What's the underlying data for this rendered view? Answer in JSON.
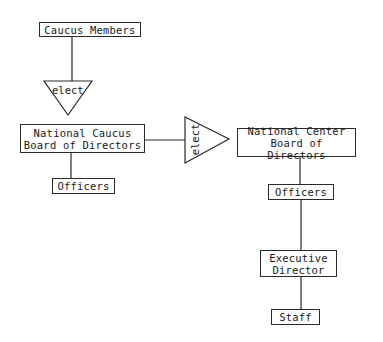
{
  "diagram": {
    "type": "organizational-chart",
    "nodes": {
      "caucus_members": "Caucus Members",
      "elect_1": "elect",
      "national_caucus_board": "National Caucus\nBoard of Directors",
      "caucus_officers": "Officers",
      "elect_2": "elect",
      "national_center_board": "National Center\nBoard of Directors",
      "center_officers": "Officers",
      "executive_director": "Executive\nDirector",
      "staff": "Staff"
    },
    "edges": [
      {
        "from": "caucus_members",
        "to": "elect_1"
      },
      {
        "from": "elect_1",
        "to": "national_caucus_board"
      },
      {
        "from": "national_caucus_board",
        "to": "caucus_officers"
      },
      {
        "from": "national_caucus_board",
        "to": "elect_2"
      },
      {
        "from": "elect_2",
        "to": "national_center_board"
      },
      {
        "from": "national_center_board",
        "to": "center_officers"
      },
      {
        "from": "center_officers",
        "to": "executive_director"
      },
      {
        "from": "executive_director",
        "to": "staff"
      }
    ],
    "colors": {
      "stroke": "#2a2a2a",
      "background": "#ffffff",
      "text": "#1a1a1a"
    }
  }
}
